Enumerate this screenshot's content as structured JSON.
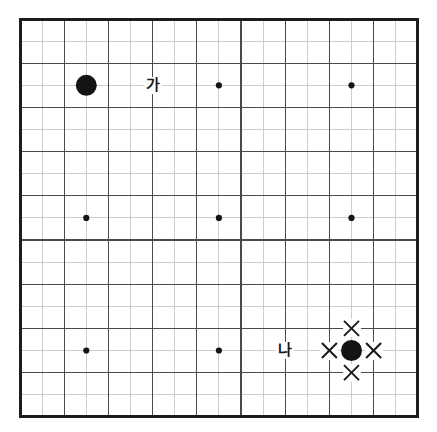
{
  "diagram": {
    "kind": "go-board-diagram",
    "board_size": 19,
    "colors": {
      "background": "#ffffff",
      "border": "#1c1c1c",
      "grid_major": "#4a4a4a",
      "grid_minor": "#c8c8c8",
      "stone_black": "#141414",
      "mark": "#1a1a1a",
      "label_text": "#1a1a1a"
    },
    "geometry": {
      "origin_x": 20,
      "origin_y": 19,
      "cell": 22.1,
      "lines": 19,
      "border_width": 3,
      "grid_major_width": 1.1,
      "grid_minor_width": 0.9
    }
  },
  "stones": [
    {
      "id": "stone-top-left",
      "color": "black",
      "col": 3,
      "row": 3,
      "radius": 10.5
    },
    {
      "id": "stone-bottom-right",
      "color": "black",
      "col": 15,
      "row": 15,
      "radius": 10.5
    }
  ],
  "star_points": [
    {
      "col": 9,
      "row": 3
    },
    {
      "col": 15,
      "row": 3
    },
    {
      "col": 3,
      "row": 9
    },
    {
      "col": 9,
      "row": 9
    },
    {
      "col": 15,
      "row": 9
    },
    {
      "col": 3,
      "row": 15
    },
    {
      "col": 9,
      "row": 15
    }
  ],
  "star_point_radius": 3.1,
  "marks": [
    {
      "id": "liberty-mark-up",
      "glyph": "x-mark",
      "col": 15,
      "row": 14,
      "size": 15
    },
    {
      "id": "liberty-mark-down",
      "glyph": "x-mark",
      "col": 15,
      "row": 16,
      "size": 15
    },
    {
      "id": "liberty-mark-left",
      "glyph": "x-mark",
      "col": 14,
      "row": 15,
      "size": 15
    },
    {
      "id": "liberty-mark-right",
      "glyph": "x-mark",
      "col": 16,
      "row": 15,
      "size": 15
    }
  ],
  "labels": [
    {
      "id": "label-ga",
      "text": "가",
      "col": 6,
      "row": 3
    },
    {
      "id": "label-na",
      "text": "나",
      "col": 12,
      "row": 15
    }
  ]
}
